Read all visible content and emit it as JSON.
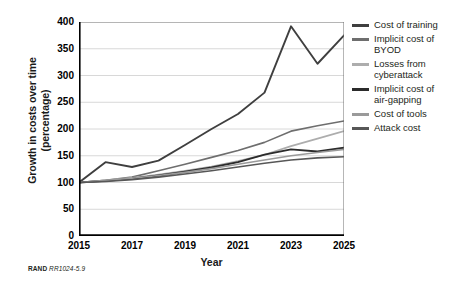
{
  "figure": {
    "footnote_org": "RAND",
    "footnote_id": "RR1024-5.9"
  },
  "axes": {
    "x_title": "Year",
    "y_title_line1": "Growth in costs over time",
    "y_title_line2": "(percentage)",
    "y_ticks": [
      "400",
      "350",
      "300",
      "250",
      "200",
      "150",
      "100",
      "50",
      "0"
    ],
    "x_ticks": [
      "2015",
      "2017",
      "2019",
      "2021",
      "2023",
      "2025"
    ]
  },
  "legend": {
    "items": [
      {
        "label": "Cost of training",
        "color": "#3f3f3f"
      },
      {
        "label": "Implicit cost of\nBYOD",
        "color": "#6e6e6e"
      },
      {
        "label": "Losses from\ncyberattack",
        "color": "#adadad"
      },
      {
        "label": "Implicit cost of\nair-gapping",
        "color": "#2b2b2b"
      },
      {
        "label": "Cost of tools",
        "color": "#9a9a9a"
      },
      {
        "label": "Attack cost",
        "color": "#575757"
      }
    ]
  },
  "chart_data": {
    "type": "line",
    "title": "",
    "xlabel": "Year",
    "ylabel": "Growth in costs over time (percentage)",
    "x": [
      2015,
      2016,
      2017,
      2018,
      2019,
      2020,
      2021,
      2022,
      2023,
      2024,
      2025
    ],
    "xlim": [
      2015,
      2025
    ],
    "ylim": [
      0,
      400
    ],
    "y_tick_values": [
      0,
      50,
      100,
      150,
      200,
      250,
      300,
      350,
      400
    ],
    "grid": "horizontal",
    "legend_position": "right",
    "series": [
      {
        "name": "Cost of training",
        "color": "#3f3f3f",
        "width": 1.9,
        "values": [
          100,
          138,
          129,
          141,
          170,
          200,
          228,
          268,
          392,
          322,
          375
        ]
      },
      {
        "name": "Implicit cost of BYOD",
        "color": "#6e6e6e",
        "width": 1.6,
        "values": [
          100,
          104,
          110,
          122,
          134,
          147,
          160,
          175,
          196,
          206,
          215
        ]
      },
      {
        "name": "Losses from cyberattack",
        "color": "#adadad",
        "width": 1.6,
        "values": [
          100,
          104,
          109,
          115,
          122,
          130,
          140,
          152,
          168,
          182,
          196
        ]
      },
      {
        "name": "Implicit cost of air-gapping",
        "color": "#2b2b2b",
        "width": 1.9,
        "values": [
          100,
          103,
          107,
          113,
          120,
          128,
          138,
          152,
          162,
          158,
          165
        ]
      },
      {
        "name": "Cost of tools",
        "color": "#9a9a9a",
        "width": 1.6,
        "values": [
          100,
          104,
          108,
          113,
          119,
          126,
          134,
          142,
          150,
          156,
          162
        ]
      },
      {
        "name": "Attack cost",
        "color": "#575757",
        "width": 1.6,
        "values": [
          100,
          102,
          105,
          110,
          116,
          122,
          129,
          136,
          142,
          146,
          148
        ]
      }
    ]
  }
}
